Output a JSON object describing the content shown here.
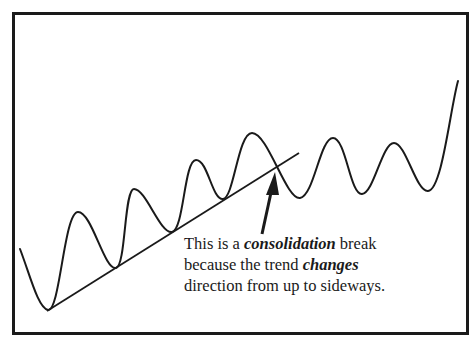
{
  "diagram": {
    "type": "price-chart-illustration",
    "caption": {
      "line1_pre": "This is a ",
      "line1_em": "consolidation",
      "line1_post": " break",
      "line2_pre": "because the trend ",
      "line2_em": "changes",
      "line3": "direction from up to sideways."
    },
    "colors": {
      "stroke": "#1a1a1a",
      "background": "#ffffff",
      "frame": "#1a1a1a"
    },
    "elements": [
      {
        "name": "price-wave",
        "kind": "curve"
      },
      {
        "name": "uptrend-line",
        "kind": "line",
        "from": [
          47,
          311
        ],
        "to": [
          299,
          153
        ]
      },
      {
        "name": "break-arrow",
        "kind": "arrow",
        "tail": [
          262,
          234
        ],
        "head": [
          275,
          172
        ]
      }
    ]
  }
}
